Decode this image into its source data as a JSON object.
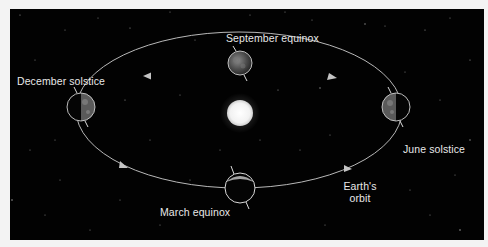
{
  "diagram": {
    "labels": {
      "september": "September equinox",
      "december": "December solstice",
      "june": "June solstice",
      "march": "March equinox",
      "orbit_line1": "Earth's",
      "orbit_line2": "orbit"
    },
    "bodies": [
      {
        "name": "Sun",
        "cx": 240,
        "cy": 113,
        "r": 13
      },
      {
        "name": "Earth (September equinox)",
        "cx": 240,
        "cy": 63,
        "r": 12
      },
      {
        "name": "Earth (December solstice)",
        "cx": 81,
        "cy": 107,
        "r": 14
      },
      {
        "name": "Earth (June solstice)",
        "cx": 396,
        "cy": 107,
        "r": 14
      },
      {
        "name": "Earth (March equinox)",
        "cx": 240,
        "cy": 188,
        "r": 15
      }
    ],
    "colors": {
      "background": "#020202",
      "frame": "#f3f3f3",
      "orbit": "#b8b8b8",
      "sun": "#f4f4f4",
      "label": "#e8e8e8"
    }
  }
}
